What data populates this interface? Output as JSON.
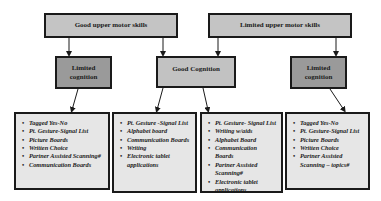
{
  "diagram": {
    "level1": [
      {
        "id": "good-motor",
        "label": "Good upper motor skills"
      },
      {
        "id": "limited-motor",
        "label": "Limited upper motor skills"
      }
    ],
    "level2": [
      {
        "id": "limited-cognition-left",
        "parent": "good-motor",
        "label": "Limited cognition"
      },
      {
        "id": "good-cognition",
        "parent": "good-motor,limited-motor",
        "label": "Good Cognition"
      },
      {
        "id": "limited-cognition-right",
        "parent": "limited-motor",
        "label": "Limited cognition"
      }
    ],
    "level3": [
      {
        "id": "list-1",
        "parent": "limited-cognition-left",
        "items": [
          "Tagged Yes-No",
          "Pt. Gesture-Signal List",
          "Picture Boards",
          "Written Choice",
          "Partner Assisted Scanning#",
          "Communication Boards"
        ]
      },
      {
        "id": "list-2",
        "parent": "good-cognition",
        "items": [
          "Pt. Gesture -Signal List",
          "Alphabet board",
          "Communication Boards",
          "Writing",
          "Electronic tablet applications"
        ]
      },
      {
        "id": "list-3",
        "parent": "good-cognition",
        "items": [
          "Pt. Gesture- Signal List",
          "Writing w/aids",
          "Alphabet Board",
          "Communication Boards",
          "Partner Assisted Scanning#",
          "Electronic tablet applications"
        ]
      },
      {
        "id": "list-4",
        "parent": "limited-cognition-right",
        "items": [
          "Tagged Yes-No",
          "Pt. Gesture-Signal List",
          "Picture Boards",
          "Written Choice",
          "Partner Assisted Scanning – topics#"
        ]
      }
    ],
    "colors": {
      "top_box": "#c4c4c4",
      "limited_cognition_box": "#9a9a9a",
      "good_cognition_box": "#c2c2c2",
      "list_box": "#e6e6e6",
      "border": "#1a1a1a"
    }
  }
}
